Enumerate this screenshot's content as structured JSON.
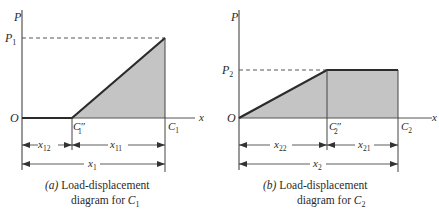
{
  "colors": {
    "axis": "#555555",
    "curve": "#2b2b2b",
    "fill": "#c4c4c4",
    "dashed": "#444444",
    "text": "#2a2a2a"
  },
  "diagram_a": {
    "axis_y_label": "P",
    "axis_x_label": "x",
    "origin_label": "O",
    "load_label": "P",
    "load_sub": "1",
    "point_mid_label": "C″",
    "point_mid_sub": "1",
    "point_end_label": "C",
    "point_end_sub": "1",
    "dim_left": "x",
    "dim_left_sub": "12",
    "dim_right": "x",
    "dim_right_sub": "11",
    "dim_total": "x",
    "dim_total_sub": "1",
    "caption_tag": "(a)",
    "caption_line1": " Load-displacement",
    "caption_line2": "diagram for ",
    "caption_sym": "C",
    "caption_sub": "1"
  },
  "diagram_b": {
    "axis_y_label": "P",
    "axis_x_label": "x",
    "origin_label": "O",
    "load_label": "P",
    "load_sub": "2",
    "point_mid_label": "C″",
    "point_mid_sub": "2",
    "point_end_label": "C",
    "point_end_sub": "2",
    "dim_left": "x",
    "dim_left_sub": "22",
    "dim_right": "x",
    "dim_right_sub": "21",
    "dim_total": "x",
    "dim_total_sub": "2",
    "caption_tag": "(b)",
    "caption_line1": " Load-displacement",
    "caption_line2": "diagram for ",
    "caption_sym": "C",
    "caption_sub": "2"
  }
}
